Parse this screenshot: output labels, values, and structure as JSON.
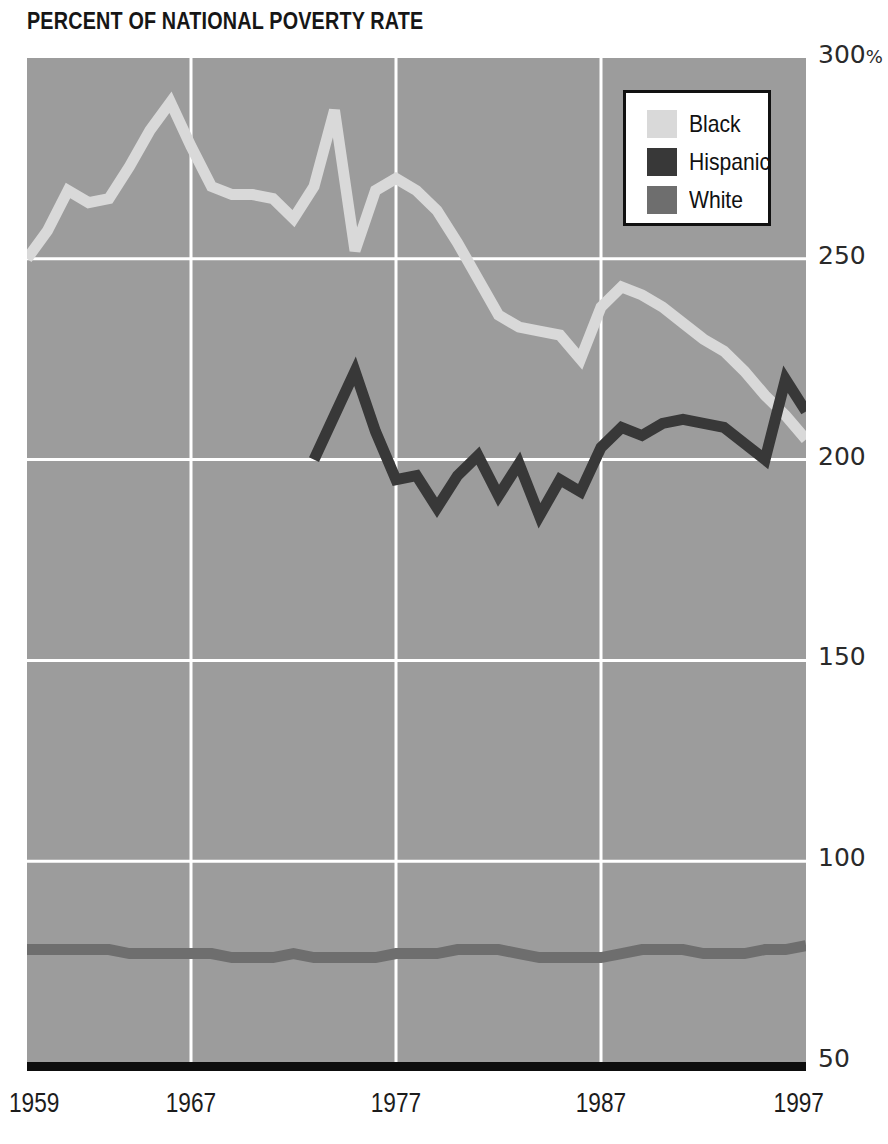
{
  "title": "PERCENT OF NATIONAL POVERTY RATE",
  "legend": {
    "items": [
      {
        "label": "Black",
        "color": "#d9d9d9"
      },
      {
        "label": "Hispanic",
        "color": "#383838"
      },
      {
        "label": "White",
        "color": "#6e6e6e"
      }
    ]
  },
  "axes": {
    "y_ticks": [
      {
        "value": 300,
        "label": "300",
        "suffix": "%"
      },
      {
        "value": 250,
        "label": "250",
        "suffix": ""
      },
      {
        "value": 200,
        "label": "200",
        "suffix": ""
      },
      {
        "value": 150,
        "label": "150",
        "suffix": ""
      },
      {
        "value": 100,
        "label": "100",
        "suffix": ""
      },
      {
        "value": 50,
        "label": "50",
        "suffix": ""
      }
    ],
    "x_ticks": [
      {
        "value": 1959,
        "label": "1959"
      },
      {
        "value": 1967,
        "label": "1967"
      },
      {
        "value": 1977,
        "label": "1977"
      },
      {
        "value": 1987,
        "label": "1987"
      },
      {
        "value": 1997,
        "label": "1997"
      }
    ]
  },
  "style": {
    "plot_background": "#9c9c9c",
    "gridline_color": "#ffffff",
    "baseline_color": "#0d0d0d",
    "text_color": "#1c1c1c"
  },
  "chart_data": {
    "type": "line",
    "title": "PERCENT OF NATIONAL POVERTY RATE",
    "xlabel": "",
    "ylabel": "Percent of national poverty rate",
    "xlim": [
      1959,
      1997
    ],
    "ylim": [
      50,
      300
    ],
    "yunit": "%",
    "grid": true,
    "legend_position": "top-right",
    "x": [
      1959,
      1960,
      1961,
      1962,
      1963,
      1964,
      1965,
      1966,
      1967,
      1968,
      1969,
      1970,
      1971,
      1972,
      1973,
      1974,
      1975,
      1976,
      1977,
      1978,
      1979,
      1980,
      1981,
      1982,
      1983,
      1984,
      1985,
      1986,
      1987,
      1988,
      1989,
      1990,
      1991,
      1992,
      1993,
      1994,
      1995,
      1996,
      1997
    ],
    "series": [
      {
        "name": "Black",
        "color": "#d9d9d9",
        "values": [
          250,
          257,
          267,
          264,
          265,
          273,
          282,
          289,
          278,
          268,
          266,
          266,
          265,
          260,
          268,
          287,
          252,
          267,
          270,
          267,
          262,
          254,
          245,
          236,
          233,
          232,
          231,
          225,
          238,
          243,
          241,
          238,
          234,
          230,
          227,
          222,
          216,
          211,
          205
        ]
      },
      {
        "name": "Hispanic",
        "color": "#383838",
        "values": [
          null,
          null,
          null,
          null,
          null,
          null,
          null,
          null,
          null,
          null,
          null,
          null,
          null,
          null,
          200,
          211,
          222,
          207,
          195,
          196,
          188,
          196,
          201,
          191,
          199,
          186,
          195,
          192,
          203,
          208,
          206,
          209,
          210,
          209,
          208,
          204,
          200,
          220,
          212
        ]
      },
      {
        "name": "White",
        "color": "#6e6e6e",
        "values": [
          78,
          78,
          78,
          78,
          78,
          77,
          77,
          77,
          77,
          77,
          76,
          76,
          76,
          77,
          76,
          76,
          76,
          76,
          77,
          77,
          77,
          78,
          78,
          78,
          77,
          76,
          76,
          76,
          76,
          77,
          78,
          78,
          78,
          77,
          77,
          77,
          78,
          78,
          79
        ]
      }
    ]
  }
}
